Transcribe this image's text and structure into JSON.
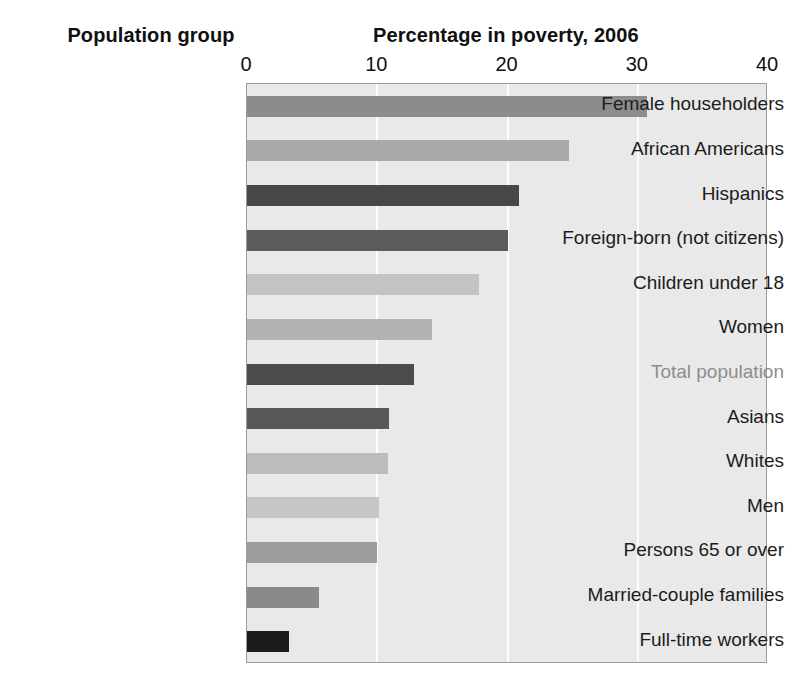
{
  "headings": {
    "group": "Population group",
    "value": "Percentage in poverty, 2006"
  },
  "colors": {
    "plot_background": "#e9e9e9",
    "plot_border": "#9b9b9b",
    "gridline": "#fdfdfd",
    "label_text": "#1c1c1c",
    "muted_label_text": "#8d8d8d"
  },
  "chart_data": {
    "type": "bar",
    "orientation": "horizontal",
    "title": "Percentage in poverty, 2006",
    "xlabel": "Percentage in poverty, 2006",
    "ylabel": "Population group",
    "xlim": [
      0,
      40
    ],
    "xticks": [
      0,
      10,
      20,
      30,
      40
    ],
    "xtick_labels": [
      "0",
      "10",
      "20",
      "30",
      "40"
    ],
    "grid": true,
    "grid_axis": "x",
    "legend": false,
    "categories": [
      "Female householders",
      "African Americans",
      "Hispanics",
      "Foreign-born (not citizens)",
      "Children under 18",
      "Women",
      "Total population",
      "Asians",
      "Whites",
      "Men",
      "Persons 65 or over",
      "Married-couple families",
      "Full-time workers"
    ],
    "values": [
      30.7,
      24.7,
      20.9,
      20.0,
      17.8,
      14.2,
      12.8,
      10.9,
      10.8,
      10.1,
      10.0,
      5.5,
      3.2
    ],
    "bar_colors": [
      "#8c8c8c",
      "#a9a9a9",
      "#474747",
      "#5b5b5b",
      "#c3c3c3",
      "#b2b2b2",
      "#4c4c4c",
      "#585858",
      "#bcbcbc",
      "#c6c6c6",
      "#9d9d9d",
      "#8a8a8a",
      "#1b1b1b"
    ],
    "muted_categories": [
      "Total population"
    ]
  }
}
